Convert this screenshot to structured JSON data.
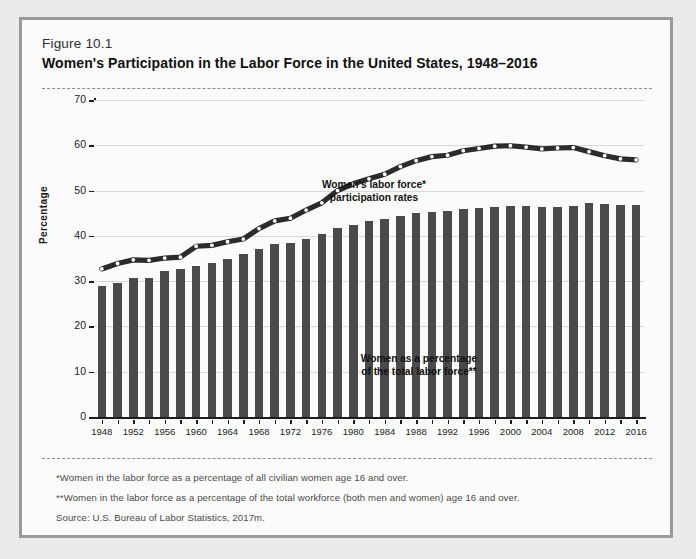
{
  "figure": {
    "number": "Figure 10.1",
    "title": "Women's Participation in the Labor Force in the United States, 1948–2016"
  },
  "notes": {
    "note1": "*Women in the labor force as a percentage of all civilian women age 16 and over.",
    "note2": "**Women in the labor force as a percentage of the total workforce (both men and women) age 16 and over.",
    "note3": "Source: U.S. Bureau of Labor Statistics, 2017m."
  },
  "colors": {
    "bar": "#4a4a4a",
    "line": "#2b2b2b",
    "marker": "#ffffff",
    "grid": "#d8d8d8",
    "axis": "#1d1d1d",
    "panel": "#fbfbfb",
    "frame": "#9a9a9a",
    "page": "#ebebeb"
  },
  "chart_data": {
    "type": "bar",
    "title": "Women's Participation in the Labor Force in the United States, 1948–2016",
    "xlabel": "",
    "ylabel": "Percentage",
    "ylim": [
      0,
      70
    ],
    "yticks": [
      0,
      10,
      20,
      30,
      40,
      50,
      60,
      70
    ],
    "grid": true,
    "legend": "none",
    "x_tick_labels": [
      "1948",
      "1952",
      "1956",
      "1960",
      "1964",
      "1968",
      "1972",
      "1976",
      "1980",
      "1984",
      "1988",
      "1992",
      "1996",
      "2000",
      "2004",
      "2008",
      "2012",
      "2016"
    ],
    "categories": [
      1948,
      1950,
      1952,
      1954,
      1956,
      1958,
      1960,
      1962,
      1964,
      1966,
      1968,
      1970,
      1972,
      1974,
      1976,
      1978,
      1980,
      1982,
      1984,
      1986,
      1988,
      1990,
      1992,
      1994,
      1996,
      1998,
      2000,
      2002,
      2004,
      2006,
      2008,
      2010,
      2012,
      2014,
      2016
    ],
    "series": [
      {
        "name": "Women as a percentage of the total labor force**",
        "render": "bar",
        "values": [
          28.9,
          29.6,
          30.8,
          30.8,
          32.2,
          32.7,
          33.4,
          34.0,
          34.8,
          36.0,
          37.1,
          38.1,
          38.5,
          39.4,
          40.5,
          41.7,
          42.5,
          43.3,
          43.8,
          44.4,
          45.0,
          45.2,
          45.5,
          46.0,
          46.2,
          46.3,
          46.6,
          46.5,
          46.4,
          46.3,
          46.5,
          47.2,
          47.0,
          46.8,
          46.8
        ],
        "value_label": "percent of total labor force"
      },
      {
        "name": "Women's labor force* participation rates",
        "render": "line",
        "values": [
          32.7,
          33.9,
          34.7,
          34.6,
          35.1,
          35.3,
          37.7,
          37.9,
          38.7,
          39.3,
          41.6,
          43.3,
          43.9,
          45.7,
          47.3,
          50.0,
          51.5,
          52.6,
          53.6,
          55.3,
          56.6,
          57.5,
          57.8,
          58.8,
          59.3,
          59.8,
          59.9,
          59.6,
          59.2,
          59.4,
          59.5,
          58.6,
          57.7,
          57.0,
          56.8
        ],
        "value_label": "labor force participation rate"
      }
    ],
    "annotations": [
      {
        "id": "line-label",
        "text_line1": "Women's labor force*",
        "text_line2": "participation rates"
      },
      {
        "id": "bar-label",
        "text_line1": "Women as a percentage",
        "text_line2": "of the total labor force**"
      }
    ]
  }
}
